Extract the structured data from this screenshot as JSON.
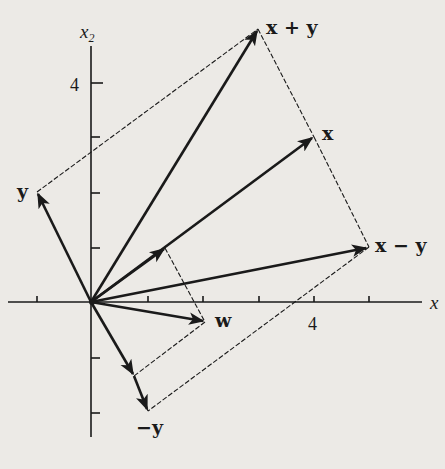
{
  "diagram": {
    "title": "",
    "axes": {
      "x_label": "x",
      "x_label_subscript": "1",
      "y_label": "x",
      "y_label_subscript": "2",
      "x_tick_label": "4",
      "y_tick_label": "4"
    },
    "vectors": [
      {
        "id": "x",
        "label": "x",
        "coords": [
          4,
          3
        ]
      },
      {
        "id": "y",
        "label": "y",
        "coords": [
          -1,
          2
        ]
      },
      {
        "id": "x_plus_y",
        "label": "x + y",
        "coords": [
          3,
          5
        ]
      },
      {
        "id": "x_minus_y",
        "label": "x − y",
        "coords": [
          5,
          1
        ]
      },
      {
        "id": "neg_y",
        "label": "−y",
        "coords": [
          1,
          -2
        ]
      },
      {
        "id": "w",
        "label": "w",
        "coords": [
          2,
          -0.35
        ]
      }
    ],
    "colors": {
      "ink": "#1a1a1a",
      "paper": "#eceae6"
    }
  }
}
